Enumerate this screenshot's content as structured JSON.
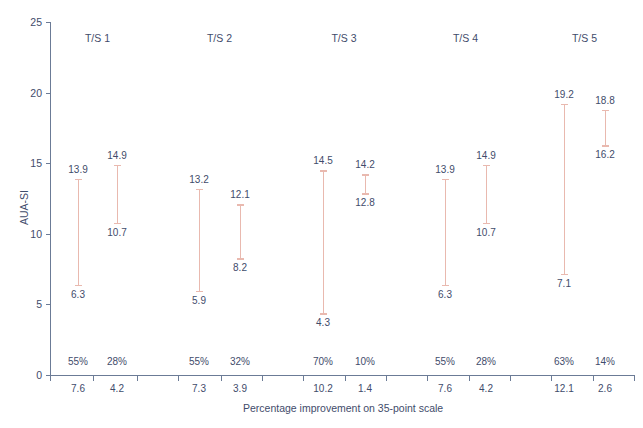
{
  "chart_data": {
    "type": "line",
    "title": "",
    "xlabel": "Percentage improvement on 35-point scale",
    "ylabel": "AUA-SI",
    "ylim": [
      0,
      25
    ],
    "yticks": [
      0,
      5,
      10,
      15,
      20,
      25
    ],
    "grid": false,
    "legend": null,
    "group_labels": [
      "T/S 1",
      "T/S 2",
      "T/S 3",
      "T/S 4",
      "T/S 5"
    ],
    "series_note": "Each trial/study (T/S) shows two vertical range bars: baseline AUA-SI (top value) down to post-treatment AUA-SI (bottom value); percentage improvement and absolute point improvement on a 35-point scale are printed beneath.",
    "groups": [
      {
        "label": "T/S 1",
        "arms": [
          {
            "top": 13.9,
            "bottom": 6.3,
            "percent": "55%",
            "points": "7.6"
          },
          {
            "top": 14.9,
            "bottom": 10.7,
            "percent": "28%",
            "points": "4.2"
          }
        ]
      },
      {
        "label": "T/S 2",
        "arms": [
          {
            "top": 13.2,
            "bottom": 5.9,
            "percent": "55%",
            "points": "7.3"
          },
          {
            "top": 12.1,
            "bottom": 8.2,
            "percent": "32%",
            "points": "3.9"
          }
        ]
      },
      {
        "label": "T/S 3",
        "arms": [
          {
            "top": 14.5,
            "bottom": 4.3,
            "percent": "70%",
            "points": "10.2"
          },
          {
            "top": 14.2,
            "bottom": 12.8,
            "percent": "10%",
            "points": "1.4"
          }
        ]
      },
      {
        "label": "T/S 4",
        "arms": [
          {
            "top": 13.9,
            "bottom": 6.3,
            "percent": "55%",
            "points": "7.6"
          },
          {
            "top": 14.9,
            "bottom": 10.7,
            "percent": "28%",
            "points": "4.2"
          }
        ]
      },
      {
        "label": "T/S 5",
        "arms": [
          {
            "top": 19.2,
            "bottom": 7.1,
            "percent": "63%",
            "points": "12.1"
          },
          {
            "top": 18.8,
            "bottom": 16.2,
            "percent": "14%",
            "points": "2.6"
          }
        ]
      }
    ],
    "colors": {
      "range_bar": "#e9b9af",
      "text": "#3f4c6b",
      "axis": "#6b7b96",
      "background": "#ffffff"
    }
  }
}
